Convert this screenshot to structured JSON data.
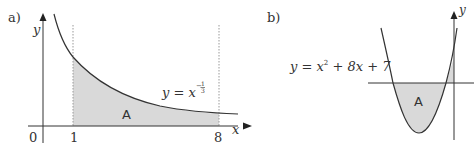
{
  "figure_a": {
    "panel_label": "a)",
    "y_axis_label": "y",
    "x_axis_label": "x",
    "origin_label": "0",
    "x_tick_1": "1",
    "x_tick_8": "8",
    "equation_lhs": "y = x",
    "equation_exponent": "-1/3",
    "equation_num": "1",
    "equation_den": "3",
    "region_label": "A",
    "function": "y = x^(-1/3)",
    "bounds": [
      1,
      8
    ]
  },
  "figure_b": {
    "panel_label": "b)",
    "y_axis_label": "y",
    "equation": "y = x² + 8x + 7",
    "equation_part1": "y = x",
    "equation_sup": "2",
    "equation_part2": " + 8x + 7",
    "region_label": "A",
    "function": "y = x^2 + 8x + 7"
  },
  "colors": {
    "line": "#333333",
    "shade": "#d9d9d9",
    "dotted": "#999999"
  }
}
